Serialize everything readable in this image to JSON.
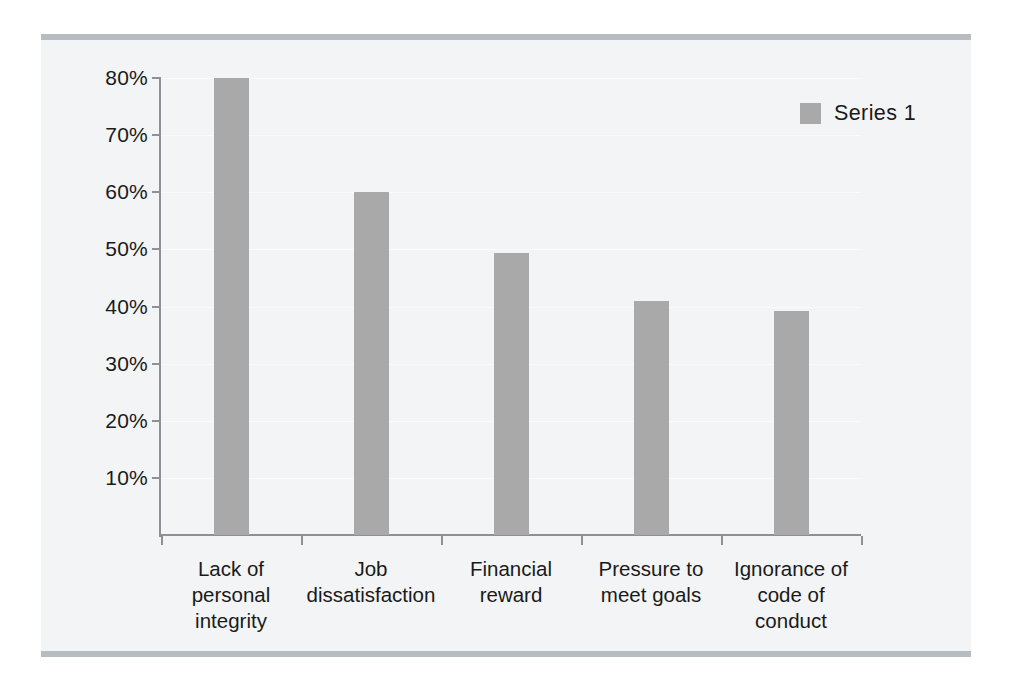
{
  "chart_data": {
    "type": "bar",
    "title": "",
    "subtitle": "",
    "xlabel": "",
    "ylabel": "",
    "categories": [
      "Lack of\npersonal\nintegrity",
      "Job\ndissatisfaction",
      "Financial\nreward",
      "Pressure to\nmeet goals",
      "Ignorance of\ncode of\nconduct"
    ],
    "categories_flat": [
      "Lack of personal integrity",
      "Job dissatisfaction",
      "Financial reward",
      "Pressure to meet goals",
      "Ignorance of code of conduct"
    ],
    "series": [
      {
        "name": "Series 1",
        "values": [
          80,
          60,
          49.3,
          41,
          39.3
        ]
      }
    ],
    "values": [
      80,
      60,
      49.3,
      41,
      39.3
    ],
    "value_format": "percent",
    "ylim": [
      0,
      80
    ],
    "yticks": [
      10,
      20,
      30,
      40,
      50,
      60,
      70,
      80
    ],
    "ytick_labels": [
      "10%",
      "20%",
      "30%",
      "40%",
      "50%",
      "60%",
      "70%",
      "80%"
    ],
    "grid": true,
    "grid_axis": "y",
    "legend": {
      "position": "top-right",
      "entries": [
        {
          "label": "Series 1",
          "color": "#a9a9a9"
        }
      ]
    },
    "colors": {
      "bar": "#a9a9a9",
      "axis": "#8d9094",
      "gridline": "#fbfbfc",
      "plot_background": "#f3f4f5",
      "rule": "#b7bcc0",
      "text": "#1a1a1a"
    }
  }
}
